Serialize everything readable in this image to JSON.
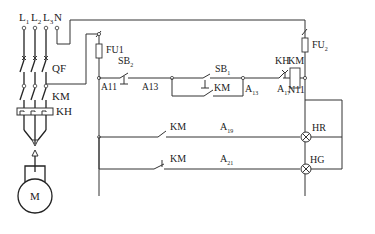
{
  "diagram": {
    "type": "electrical-control-circuit",
    "power_circuit": {
      "phases": [
        {
          "label": "L",
          "sub": "1"
        },
        {
          "label": "L",
          "sub": "2"
        },
        {
          "label": "L",
          "sub": "3"
        }
      ],
      "neutral": "N",
      "breaker": "QF",
      "contactor_main": "KM",
      "thermal_relay": "KH",
      "motor": "M"
    },
    "control_circuit": {
      "fuse_left": "FU1",
      "fuse_right": {
        "label": "FU",
        "sub": "2"
      },
      "start_button": {
        "label": "SB",
        "sub": "2"
      },
      "stop_button": {
        "label": "SB",
        "sub": "1"
      },
      "hold_contact": "KM",
      "thermal_contact": "KH",
      "coil": "KM",
      "nodes": {
        "a11": "A11",
        "a13": "A13",
        "a13b": {
          "label": "A",
          "sub": "13"
        },
        "a17": {
          "label": "A",
          "sub": "17"
        },
        "n11": "N11",
        "a19": {
          "label": "A",
          "sub": "19"
        },
        "a21": {
          "label": "A",
          "sub": "21"
        }
      },
      "lamp_branch_red": {
        "contact": "KM",
        "lamp": "HR"
      },
      "lamp_branch_green": {
        "contact": "KM",
        "lamp": "HG"
      }
    }
  }
}
